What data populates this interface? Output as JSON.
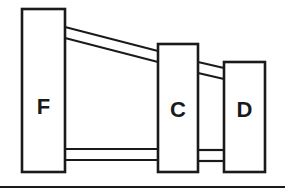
{
  "diagram": {
    "nodes": [
      {
        "id": "F",
        "label": "F"
      },
      {
        "id": "C",
        "label": "C"
      },
      {
        "id": "D",
        "label": "D"
      }
    ],
    "connections": [
      {
        "from": "F",
        "to": "C",
        "position": "upper"
      },
      {
        "from": "F",
        "to": "C",
        "position": "lower"
      },
      {
        "from": "C",
        "to": "D",
        "position": "upper"
      },
      {
        "from": "C",
        "to": "D",
        "position": "lower"
      }
    ],
    "colors": {
      "stroke": "#1a1a1a",
      "background": "#ffffff"
    }
  }
}
